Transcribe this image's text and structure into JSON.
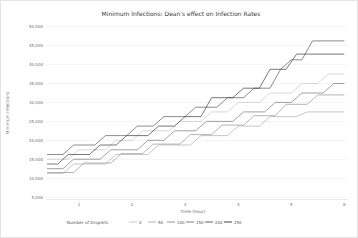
{
  "figure": {
    "background": "#ffffff",
    "border_color": "#e4e4e4",
    "grid_color": "#e9e9e9",
    "spine_color": "#d9d9d9",
    "tick_text_color": "#6b6b6b",
    "title_color": "#3a3a3a"
  },
  "chart_data": {
    "type": "line",
    "title": "Minimum Infections: Dean's effect on Infection Rates",
    "xlabel": "Time (hour)",
    "ylabel": "Minimum Infections",
    "legend_title": "Number of Droplets",
    "legend_position": "bottom",
    "grid": "horizontal",
    "x_ticks": [
      1,
      2,
      3,
      4,
      5,
      6
    ],
    "y_ticks": [
      5000,
      10000,
      15000,
      20000,
      25000,
      30000,
      35000,
      40000,
      45000,
      50000
    ],
    "xlim": [
      0.38,
      6.05
    ],
    "ylim": [
      4500,
      51500
    ],
    "series": [
      {
        "name": "0",
        "color": "#c3c3c3",
        "points": [
          [
            0.4,
            15000
          ],
          [
            0.8,
            15000
          ],
          [
            1.0,
            17500
          ],
          [
            1.5,
            17500
          ],
          [
            1.7,
            20000
          ],
          [
            2.0,
            20000
          ],
          [
            2.2,
            22500
          ],
          [
            2.7,
            22500
          ],
          [
            2.9,
            25000
          ],
          [
            3.3,
            25000
          ],
          [
            3.5,
            27500
          ],
          [
            3.8,
            27500
          ],
          [
            4.0,
            30000
          ],
          [
            4.4,
            30000
          ],
          [
            4.6,
            32500
          ],
          [
            5.0,
            32500
          ],
          [
            5.2,
            35000
          ],
          [
            5.5,
            35000
          ],
          [
            5.7,
            37500
          ],
          [
            6.0,
            37500
          ]
        ]
      },
      {
        "name": "50",
        "color": "#a8a8a8",
        "points": [
          [
            0.4,
            11250
          ],
          [
            0.7,
            11250
          ],
          [
            0.9,
            13750
          ],
          [
            1.5,
            13750
          ],
          [
            1.7,
            16250
          ],
          [
            2.3,
            16250
          ],
          [
            2.5,
            18750
          ],
          [
            3.1,
            18750
          ],
          [
            3.3,
            21250
          ],
          [
            3.8,
            21250
          ],
          [
            4.0,
            23750
          ],
          [
            4.4,
            23750
          ],
          [
            4.6,
            26250
          ],
          [
            5.1,
            26250
          ],
          [
            5.3,
            27500
          ],
          [
            6.0,
            27500
          ]
        ]
      },
      {
        "name": "100",
        "color": "#8d8d8d",
        "points": [
          [
            0.4,
            11500
          ],
          [
            0.9,
            11500
          ],
          [
            1.1,
            14000
          ],
          [
            1.6,
            14000
          ],
          [
            1.8,
            16500
          ],
          [
            2.2,
            16500
          ],
          [
            2.4,
            19000
          ],
          [
            2.9,
            19000
          ],
          [
            3.1,
            21500
          ],
          [
            3.5,
            21500
          ],
          [
            3.7,
            24000
          ],
          [
            4.1,
            24000
          ],
          [
            4.3,
            26500
          ],
          [
            4.7,
            26500
          ],
          [
            4.9,
            29500
          ],
          [
            5.3,
            29500
          ],
          [
            5.5,
            32000
          ],
          [
            6.0,
            32000
          ]
        ]
      },
      {
        "name": "150",
        "color": "#707070",
        "points": [
          [
            0.4,
            12500
          ],
          [
            0.7,
            12500
          ],
          [
            0.9,
            15000
          ],
          [
            1.4,
            15000
          ],
          [
            1.6,
            17500
          ],
          [
            2.1,
            17500
          ],
          [
            2.3,
            20000
          ],
          [
            2.6,
            20000
          ],
          [
            2.8,
            22500
          ],
          [
            3.2,
            22500
          ],
          [
            3.4,
            25000
          ],
          [
            3.9,
            25000
          ],
          [
            4.1,
            27500
          ],
          [
            4.5,
            27500
          ],
          [
            4.7,
            30000
          ],
          [
            5.0,
            30000
          ],
          [
            5.2,
            32500
          ],
          [
            5.6,
            32500
          ],
          [
            5.8,
            35000
          ],
          [
            6.0,
            35000
          ]
        ]
      },
      {
        "name": "200",
        "color": "#4f4f4f",
        "points": [
          [
            0.4,
            16250
          ],
          [
            0.7,
            16250
          ],
          [
            0.9,
            18750
          ],
          [
            1.3,
            18750
          ],
          [
            1.5,
            21250
          ],
          [
            1.9,
            21250
          ],
          [
            2.1,
            23750
          ],
          [
            2.4,
            23750
          ],
          [
            2.6,
            26250
          ],
          [
            3.0,
            26250
          ],
          [
            3.2,
            28750
          ],
          [
            3.6,
            28750
          ],
          [
            3.8,
            31250
          ],
          [
            4.1,
            31250
          ],
          [
            4.3,
            33750
          ],
          [
            4.6,
            33750
          ],
          [
            4.8,
            38750
          ],
          [
            5.0,
            41250
          ],
          [
            5.2,
            41250
          ],
          [
            5.4,
            46250
          ],
          [
            6.0,
            46250
          ]
        ]
      },
      {
        "name": "250",
        "color": "#2e2e2e",
        "points": [
          [
            0.4,
            13750
          ],
          [
            0.6,
            13750
          ],
          [
            0.8,
            16250
          ],
          [
            1.2,
            16250
          ],
          [
            1.4,
            18750
          ],
          [
            1.7,
            18750
          ],
          [
            1.9,
            21250
          ],
          [
            2.3,
            21250
          ],
          [
            2.5,
            23750
          ],
          [
            2.8,
            23750
          ],
          [
            3.0,
            26250
          ],
          [
            3.3,
            26250
          ],
          [
            3.5,
            31250
          ],
          [
            3.9,
            31250
          ],
          [
            4.1,
            33750
          ],
          [
            4.4,
            33750
          ],
          [
            4.6,
            38750
          ],
          [
            4.9,
            38750
          ],
          [
            5.1,
            42750
          ],
          [
            6.0,
            42750
          ]
        ]
      }
    ]
  }
}
